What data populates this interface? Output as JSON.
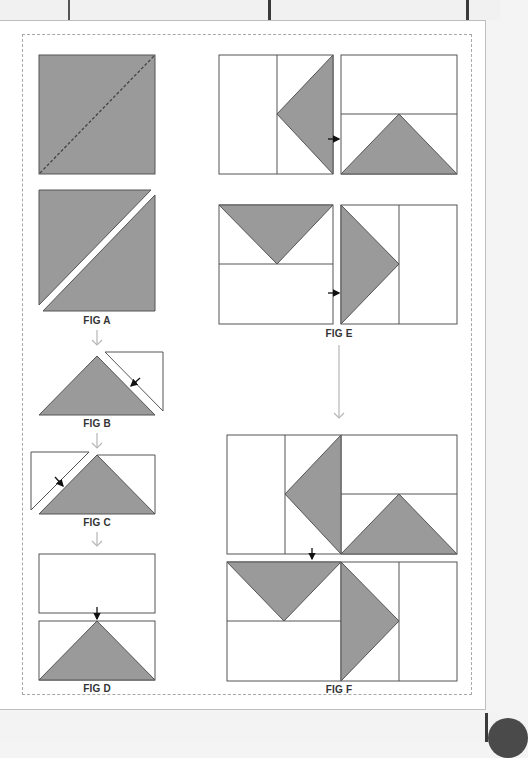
{
  "figures": {
    "fig_a": {
      "label": "FIG A"
    },
    "fig_b": {
      "label": "FIG B"
    },
    "fig_c": {
      "label": "FIG C"
    },
    "fig_d": {
      "label": "FIG D"
    },
    "fig_e": {
      "label": "FIG E"
    },
    "fig_f": {
      "label": "FIG F"
    }
  },
  "colors": {
    "fabric_gray": "#9a9a9a",
    "outline": "#555555",
    "arrow_light": "#b5b5b5",
    "arrow_dark": "#111111",
    "background": "#ffffff"
  }
}
